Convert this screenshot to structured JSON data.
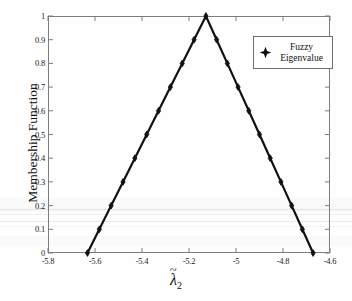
{
  "chart_data": {
    "type": "line",
    "title": "",
    "xlabel": "λ̃2",
    "xlabel_parts": {
      "symbol": "λ",
      "accent": "~",
      "subscript": "2"
    },
    "ylabel": "Membership Function",
    "xlim": [
      -5.8,
      -4.6
    ],
    "ylim": [
      0,
      1
    ],
    "xticks": [
      "-5.8",
      "-5.6",
      "-5.4",
      "-5.2",
      "-5",
      "-4.8",
      "-4.6"
    ],
    "xtick_values": [
      -5.8,
      -5.6,
      -5.4,
      -5.2,
      -5.0,
      -4.8,
      -4.6
    ],
    "yticks": [
      "0",
      "0.1",
      "0.2",
      "0.3",
      "0.4",
      "0.5",
      "0.6",
      "0.7",
      "0.8",
      "0.9",
      "1"
    ],
    "ytick_values": [
      0,
      0.1,
      0.2,
      0.3,
      0.4,
      0.5,
      0.6,
      0.7,
      0.8,
      0.9,
      1
    ],
    "grid": false,
    "legend_position": "top-right",
    "series": [
      {
        "name": "Fuzzy Eigenvalue",
        "marker": "diamond",
        "color": "#111111",
        "line_width": 2.2,
        "x": [
          -5.632,
          -5.5816,
          -5.5312,
          -5.4808,
          -5.4304,
          -5.38,
          -5.3296,
          -5.2792,
          -5.2288,
          -5.1784,
          -5.128,
          -5.0824,
          -5.0368,
          -4.9912,
          -4.9456,
          -4.9,
          -4.8544,
          -4.8088,
          -4.7632,
          -4.7176,
          -4.672
        ],
        "y": [
          0,
          0.1,
          0.2,
          0.3,
          0.4,
          0.5,
          0.6,
          0.7,
          0.8,
          0.9,
          1,
          0.9,
          0.8,
          0.7,
          0.6,
          0.5,
          0.4,
          0.3,
          0.2,
          0.1,
          0
        ]
      }
    ],
    "annotations": {
      "support_left": -5.632,
      "peak": -5.128,
      "support_right": -4.672
    }
  },
  "legend": {
    "entries": [
      {
        "label_line1": "Fuzzy",
        "label_line2": "Eigenvalue",
        "marker": "diamond-marker"
      }
    ]
  },
  "colors": {
    "line": "#111111",
    "marker": "#111111",
    "axis": "#7d7d7d",
    "text": "#1a1a1a",
    "background": "#fefefe",
    "legend_border": "#6e6e6e"
  }
}
